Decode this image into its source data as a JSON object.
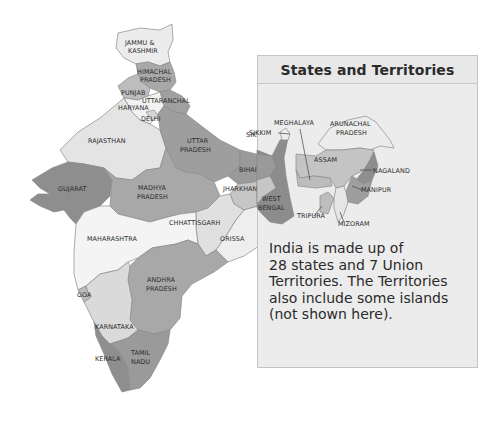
{
  "panel": {
    "title": "States and Territories",
    "body_lines": [
      "India is made up of",
      "28 states and 7 Union",
      "Territories. The Territories",
      "also include some islands",
      "(not shown here)."
    ]
  },
  "labels": {
    "jammu_kashmir": [
      "JAMMU &",
      "KASHMIR"
    ],
    "himachal": [
      "HIMACHAL",
      "PRADESH"
    ],
    "punjab": "PUNJAB",
    "uttaranchal": "UTTARANCHAL",
    "haryana": "HARYANA",
    "delhi": "DELHI",
    "rajasthan": "RAJASTHAN",
    "uttar_pradesh": [
      "UTTAR",
      "PRADESH"
    ],
    "sikkim": "SIKKIM",
    "meghalaya": "MEGHALAYA",
    "arunachal": [
      "ARUNACHAL",
      "PRADESH"
    ],
    "assam": "ASSAM",
    "nagaland": "NAGALAND",
    "manipur": "MANIPUR",
    "tripura": "TRIPURA",
    "mizoram": "MIZORAM",
    "bihar": "BIHAR",
    "jharkhand": "JHARKHAND",
    "west_bengal": [
      "WEST",
      "BENGAL"
    ],
    "gujarat": "GUJARAT",
    "madhya_pradesh": [
      "MADHYA",
      "PRADESH"
    ],
    "chhattisgarh": "CHHATTISGARH",
    "orissa": "ORISSA",
    "maharashtra": "MAHARASHTRA",
    "andhra_pradesh": [
      "ANDHRA",
      "PRADESH"
    ],
    "goa": "GOA",
    "karnataka": "KARNATAKA",
    "kerala": "KERALA",
    "tamil_nadu": [
      "TAMIL",
      "NADU"
    ]
  },
  "colors": {
    "light": "#e6e6e6",
    "lighter": "#f2f2f2",
    "mid": "#bdbdbd",
    "dark": "#9a9a9a",
    "darker": "#8a8a8a",
    "panel_bg": "#ececec"
  }
}
